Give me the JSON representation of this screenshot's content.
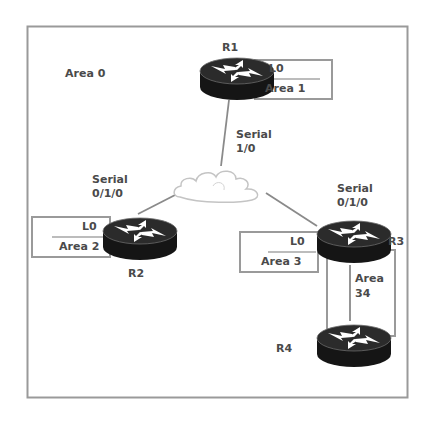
{
  "diagram": {
    "type": "OSPF network topology",
    "backbone_area_label": "Area 0",
    "colors": {
      "frame": "#9a9a9a",
      "link": "#8a8a8a",
      "router_body": "#1a1a1a",
      "router_top": "#2a2a2a",
      "arrow": "#ffffff",
      "text": "#4a4a4a",
      "cloud_stroke": "#bdbdbd"
    },
    "routers": [
      {
        "id": "R1",
        "label": "R1",
        "loopback": {
          "name": "L0",
          "area": "Area 1"
        }
      },
      {
        "id": "R2",
        "label": "R2",
        "loopback": {
          "name": "L0",
          "area": "Area 2"
        }
      },
      {
        "id": "R3",
        "label": "R3",
        "loopback": {
          "name": "L0",
          "area": "Area 3"
        }
      },
      {
        "id": "R4",
        "label": "R4"
      }
    ],
    "interfaces": {
      "r1": {
        "line1": "Serial",
        "line2": "1/0"
      },
      "r2": {
        "line1": "Serial",
        "line2": "0/1/0"
      },
      "r3": {
        "line1": "Serial",
        "line2": "0/1/0"
      }
    },
    "cloud": {
      "name": "frame-relay-cloud"
    },
    "r3_r4_area": {
      "line1": "Area",
      "line2": "34"
    },
    "links": [
      {
        "from": "R1",
        "to": "cloud"
      },
      {
        "from": "R2",
        "to": "cloud"
      },
      {
        "from": "R3",
        "to": "cloud"
      },
      {
        "from": "R3",
        "to": "R4"
      }
    ]
  }
}
